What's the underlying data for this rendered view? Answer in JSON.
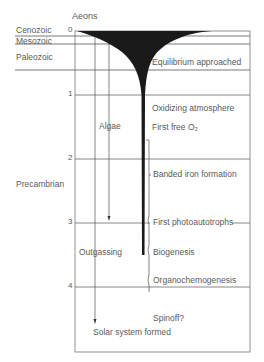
{
  "axis": {
    "title": "Aeons",
    "ticks": [
      "0",
      "1",
      "2",
      "3",
      "4"
    ]
  },
  "eras": {
    "cenozoic": "Cenozoic",
    "mesozoic": "Mesozoic",
    "paleozoic": "Paleozoic",
    "precambrian": "Precambrian"
  },
  "processes": {
    "algae": "Algae",
    "outgassing": "Outgassing"
  },
  "events": {
    "equilibrium": "Equilibrium approached",
    "oxidizing": "Oxidizing atmosphere",
    "first_free_o2": "First free O₂",
    "banded_iron": "Banded iron formation",
    "first_photo": "First photoautotrophs",
    "biogenesis": "Biogenesis",
    "organochemo": "Organochemogenesis",
    "spinoff": "Spinoff?",
    "solar_system": "Solar system formed"
  },
  "colors": {
    "line": "#444444",
    "fill": "#1a1a1a",
    "text": "#5a5a5a"
  }
}
